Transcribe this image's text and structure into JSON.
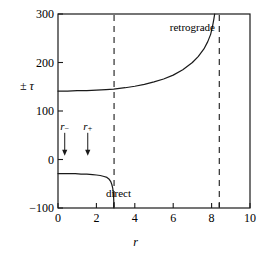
{
  "chart_data": {
    "type": "line",
    "title": "",
    "xlabel": "r",
    "ylabel": "± τ",
    "xlim": [
      0,
      10
    ],
    "ylim": [
      -100,
      300
    ],
    "xticks": [
      0,
      2,
      4,
      6,
      8,
      10
    ],
    "xtick_labels": [
      "0",
      "2",
      "4",
      "6",
      "8",
      "10"
    ],
    "yticks": [
      -100,
      0,
      100,
      200,
      300
    ],
    "ytick_labels": [
      "-100",
      "0",
      "100",
      "200",
      "300"
    ],
    "grid": false,
    "legend": "none",
    "extra_xticks": [
      2.9,
      8.4
    ],
    "series": [
      {
        "name": "retrograde",
        "label": "retrograde",
        "label_x": 7.0,
        "label_y": 272,
        "asymptote_x": 8.15,
        "x": [
          0.0,
          0.5,
          1.0,
          1.5,
          2.0,
          2.5,
          2.9,
          3.5,
          4.0,
          4.5,
          5.0,
          5.5,
          6.0,
          6.5,
          7.0,
          7.3,
          7.6,
          7.8,
          7.95,
          8.05,
          8.12,
          8.16
        ],
        "y": [
          141,
          141,
          142,
          142,
          143,
          144,
          145,
          148,
          151,
          155,
          160,
          166,
          174,
          185,
          200,
          212,
          228,
          243,
          258,
          275,
          290,
          300
        ]
      },
      {
        "name": "direct",
        "label": "direct",
        "label_x": 3.15,
        "label_y": -72,
        "asymptote_x": 2.92,
        "x": [
          0.0,
          0.3,
          0.6,
          0.9,
          1.2,
          1.5,
          1.8,
          2.0,
          2.2,
          2.4,
          2.55,
          2.65,
          2.74,
          2.8,
          2.85,
          2.88,
          2.9,
          2.915
        ],
        "y": [
          -29,
          -29,
          -29,
          -29,
          -30,
          -30,
          -31,
          -32,
          -33,
          -35,
          -37,
          -40,
          -45,
          -51,
          -59,
          -68,
          -80,
          -100
        ]
      }
    ],
    "vlines": [
      {
        "name": "inner-asymptote",
        "x": 2.92,
        "style": "dashed"
      },
      {
        "name": "outer-asymptote",
        "x": 8.4,
        "style": "dashed"
      }
    ],
    "annotations": [
      {
        "name": "r-minus",
        "label": "r",
        "subscript": "−",
        "x": 0.35,
        "label_y": 68,
        "arrow_from_y": 55,
        "arrow_to_y": 10
      },
      {
        "name": "r-plus",
        "label": "r",
        "subscript": "+",
        "x": 1.55,
        "label_y": 68,
        "arrow_from_y": 55,
        "arrow_to_y": 10
      }
    ]
  }
}
